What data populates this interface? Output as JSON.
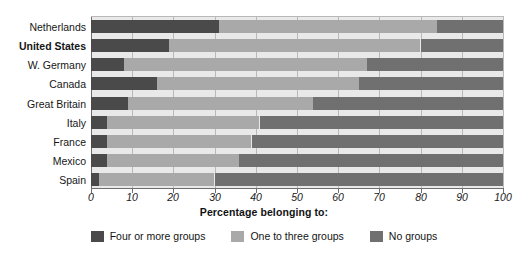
{
  "chart_data": {
    "type": "bar",
    "orientation": "horizontal",
    "stacked": true,
    "title": "",
    "xlabel": "Percentage belonging to:",
    "ylabel": "",
    "xlim": [
      0,
      100
    ],
    "xticks": [
      "0",
      "10",
      "20",
      "30",
      "40",
      "50",
      "60",
      "70",
      "80",
      "90",
      "100"
    ],
    "grid": true,
    "legend_position": "bottom",
    "categories": [
      "Netherlands",
      "United States",
      "W. Germany",
      "Canada",
      "Great Britain",
      "Italy",
      "France",
      "Mexico",
      "Spain"
    ],
    "emphasized_category": "United States",
    "series": [
      {
        "name": "Four or more groups",
        "color": "#4a4a4a",
        "values": [
          31,
          19,
          8,
          16,
          9,
          4,
          4,
          4,
          2
        ]
      },
      {
        "name": "One to three groups",
        "color": "#a9a9a9",
        "values": [
          53,
          61,
          59,
          49,
          45,
          37,
          35,
          32,
          28
        ]
      },
      {
        "name": "No groups",
        "color": "#707070",
        "values": [
          16,
          20,
          33,
          35,
          46,
          59,
          61,
          64,
          70
        ]
      }
    ]
  },
  "legend": {
    "items": [
      {
        "label": "Four or more groups",
        "color": "#4a4a4a"
      },
      {
        "label": "One to three groups",
        "color": "#a9a9a9"
      },
      {
        "label": "No groups",
        "color": "#707070"
      }
    ]
  },
  "axis": {
    "x_title": "Percentage belonging to:"
  },
  "colors": {
    "plot_background": "#e9e9e9",
    "gridline": "#b9b9b9",
    "axis": "#6e6e6e",
    "page_background": "#ffffff",
    "text": "#141414"
  }
}
